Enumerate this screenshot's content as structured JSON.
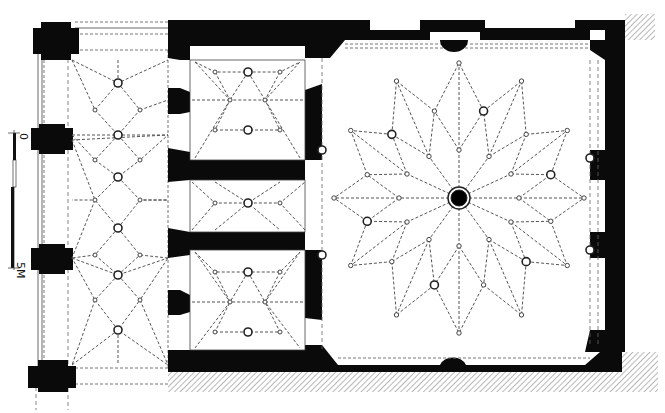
{
  "drawing": {
    "type": "architectural vault plan",
    "scale_bar": {
      "start_label": "0",
      "end_label": "5M",
      "segments": 5
    },
    "rooms": [
      {
        "name": "west-aisle",
        "vault": "star-rib vault"
      },
      {
        "name": "north-chamber",
        "vault": "star-rib vault"
      },
      {
        "name": "middle-passage",
        "vault": "star-rib vault"
      },
      {
        "name": "south-chamber",
        "vault": "star-rib vault"
      },
      {
        "name": "main-hall",
        "vault": "net/star-rib vault with central oculus"
      }
    ],
    "colors": {
      "wall": "#0a0a0a",
      "rib": "#555555",
      "background": "#ffffff",
      "hatch": "#888888"
    }
  }
}
